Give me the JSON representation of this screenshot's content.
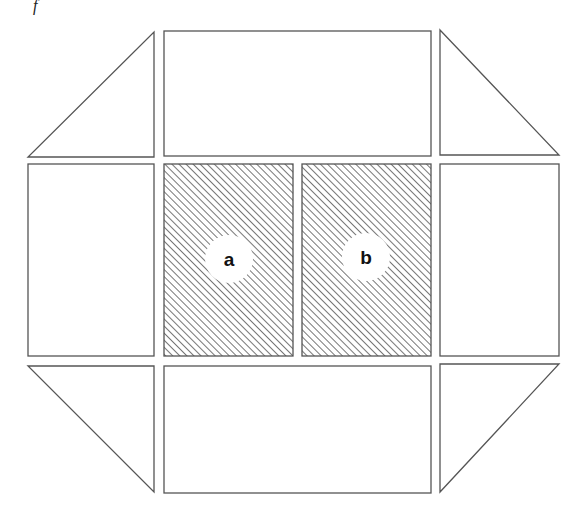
{
  "figure": {
    "corner_mark": "f",
    "panels": {
      "a": {
        "label": "a"
      },
      "b": {
        "label": "b"
      }
    },
    "colors": {
      "stroke": "#555555",
      "hatch": "#777777",
      "background": "#ffffff"
    }
  }
}
